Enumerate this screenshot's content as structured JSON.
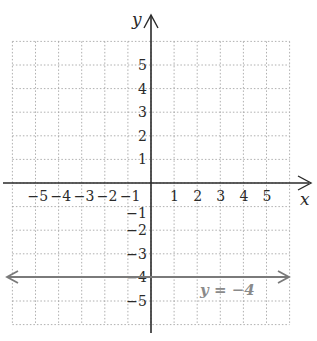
{
  "title_fragment": "",
  "axes": {
    "x_label": "x",
    "y_label": "y",
    "x_ticks": [
      "-5",
      "-4",
      "-3",
      "-2",
      "-1",
      "1",
      "2",
      "3",
      "4",
      "5"
    ],
    "y_ticks": [
      "5",
      "4",
      "3",
      "2",
      "1",
      "-1",
      "-2",
      "-3",
      "-4",
      "-5"
    ],
    "x_range": [
      -6,
      6
    ],
    "y_range": [
      -6,
      6
    ]
  },
  "line": {
    "equation": "y = −4",
    "y_value": -4,
    "color": "#7a7a7a"
  },
  "colors": {
    "axis": "#2a2a2a",
    "grid": "#9a9a9a"
  }
}
